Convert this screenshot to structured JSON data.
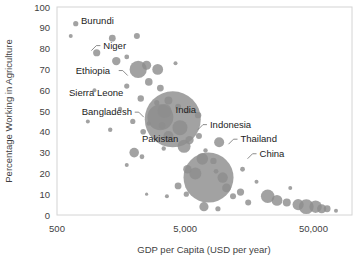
{
  "chart_data": {
    "type": "scatter",
    "title": "",
    "xlabel": "GDP per Capita (USD per year)",
    "ylabel": "Percentage Working in Agriculture",
    "xscale": "log",
    "xlim": [
      500,
      100000
    ],
    "ylim": [
      0,
      100
    ],
    "xticks": [
      "500",
      "5,000",
      "50,000"
    ],
    "xtick_values": [
      500,
      5000,
      50000
    ],
    "yticks": [
      "0",
      "10",
      "20",
      "30",
      "40",
      "50",
      "60",
      "70",
      "80",
      "90",
      "100"
    ],
    "ytick_values": [
      0,
      10,
      20,
      30,
      40,
      50,
      60,
      70,
      80,
      90,
      100
    ],
    "grid": false,
    "legend": "none",
    "bubble_color": "#8d8d8d",
    "border_color": "#d4d4d4",
    "annotations": [
      {
        "label": "Burundi",
        "x": 770,
        "y": 92,
        "anchor": "start"
      },
      {
        "label": "Niger",
        "x": 1150,
        "y": 80,
        "anchor": "start"
      },
      {
        "label": "Ethiopia",
        "x": 700,
        "y": 68,
        "anchor": "start"
      },
      {
        "label": "Sierra Leone",
        "x": 620,
        "y": 57,
        "anchor": "start"
      },
      {
        "label": "Bangladesh",
        "x": 780,
        "y": 48,
        "anchor": "start"
      },
      {
        "label": "India",
        "x": 4200,
        "y": 49,
        "anchor": "start"
      },
      {
        "label": "Pakistan",
        "x": 2300,
        "y": 35,
        "anchor": "start"
      },
      {
        "label": "Indonesia",
        "x": 7800,
        "y": 42,
        "anchor": "start"
      },
      {
        "label": "Thailand",
        "x": 13500,
        "y": 35,
        "anchor": "start"
      },
      {
        "label": "China",
        "x": 19000,
        "y": 28,
        "anchor": "start"
      }
    ],
    "points": [
      {
        "x": 700,
        "y": 92,
        "r": 2.6
      },
      {
        "x": 640,
        "y": 86,
        "r": 2.0
      },
      {
        "x": 1350,
        "y": 85,
        "r": 3.4
      },
      {
        "x": 2100,
        "y": 86,
        "r": 3.0
      },
      {
        "x": 1020,
        "y": 78,
        "r": 3.6
      },
      {
        "x": 1450,
        "y": 74,
        "r": 4.2
      },
      {
        "x": 1750,
        "y": 76,
        "r": 2.4
      },
      {
        "x": 2500,
        "y": 72,
        "r": 4.6
      },
      {
        "x": 2150,
        "y": 70,
        "r": 8.6
      },
      {
        "x": 3050,
        "y": 70,
        "r": 5.4
      },
      {
        "x": 4200,
        "y": 73,
        "r": 2.0
      },
      {
        "x": 2600,
        "y": 64,
        "r": 3.8
      },
      {
        "x": 1750,
        "y": 62,
        "r": 2.6
      },
      {
        "x": 3200,
        "y": 61,
        "r": 3.4
      },
      {
        "x": 980,
        "y": 60,
        "r": 2.0
      },
      {
        "x": 2250,
        "y": 56,
        "r": 3.2
      },
      {
        "x": 3000,
        "y": 54,
        "r": 2.6
      },
      {
        "x": 3700,
        "y": 55,
        "r": 4.0
      },
      {
        "x": 4400,
        "y": 52,
        "r": 3.0
      },
      {
        "x": 1550,
        "y": 51,
        "r": 2.2
      },
      {
        "x": 5200,
        "y": 50,
        "r": 2.6
      },
      {
        "x": 6300,
        "y": 48,
        "r": 3.2
      },
      {
        "x": 870,
        "y": 45,
        "r": 2.0
      },
      {
        "x": 1950,
        "y": 45,
        "r": 2.6
      },
      {
        "x": 2600,
        "y": 44,
        "r": 2.2
      },
      {
        "x": 3300,
        "y": 43,
        "r": 3.6
      },
      {
        "x": 3200,
        "y": 47,
        "r": 13.0
      },
      {
        "x": 2350,
        "y": 40,
        "r": 2.8
      },
      {
        "x": 1300,
        "y": 41,
        "r": 2.2
      },
      {
        "x": 4000,
        "y": 46,
        "r": 28.0
      },
      {
        "x": 3450,
        "y": 50,
        "r": 7.0
      },
      {
        "x": 4550,
        "y": 42,
        "r": 7.5
      },
      {
        "x": 3700,
        "y": 38,
        "r": 5.0
      },
      {
        "x": 2000,
        "y": 30,
        "r": 4.8
      },
      {
        "x": 2300,
        "y": 28,
        "r": 2.4
      },
      {
        "x": 4900,
        "y": 33,
        "r": 6.5
      },
      {
        "x": 5400,
        "y": 36,
        "r": 4.2
      },
      {
        "x": 6400,
        "y": 38,
        "r": 3.0
      },
      {
        "x": 7200,
        "y": 31,
        "r": 2.2
      },
      {
        "x": 6800,
        "y": 27,
        "r": 5.8
      },
      {
        "x": 8300,
        "y": 26,
        "r": 3.2
      },
      {
        "x": 9200,
        "y": 35,
        "r": 5.0
      },
      {
        "x": 3400,
        "y": 32,
        "r": 2.2
      },
      {
        "x": 1750,
        "y": 24,
        "r": 2.0
      },
      {
        "x": 8700,
        "y": 21,
        "r": 2.4
      },
      {
        "x": 7600,
        "y": 18,
        "r": 25.0
      },
      {
        "x": 6000,
        "y": 20,
        "r": 6.0
      },
      {
        "x": 5200,
        "y": 22,
        "r": 4.2
      },
      {
        "x": 9800,
        "y": 18,
        "r": 5.2
      },
      {
        "x": 10500,
        "y": 13,
        "r": 4.4
      },
      {
        "x": 11800,
        "y": 9,
        "r": 3.0
      },
      {
        "x": 4400,
        "y": 14,
        "r": 3.4
      },
      {
        "x": 5100,
        "y": 10,
        "r": 2.6
      },
      {
        "x": 3600,
        "y": 9,
        "r": 2.0
      },
      {
        "x": 2500,
        "y": 10,
        "r": 1.6
      },
      {
        "x": 13500,
        "y": 11,
        "r": 3.6
      },
      {
        "x": 15500,
        "y": 6,
        "r": 3.0
      },
      {
        "x": 7000,
        "y": 4,
        "r": 4.6
      },
      {
        "x": 9000,
        "y": 3,
        "r": 2.6
      },
      {
        "x": 22000,
        "y": 9,
        "r": 6.8
      },
      {
        "x": 26000,
        "y": 7,
        "r": 5.4
      },
      {
        "x": 31000,
        "y": 6,
        "r": 4.0
      },
      {
        "x": 38000,
        "y": 5,
        "r": 5.6
      },
      {
        "x": 44000,
        "y": 4,
        "r": 7.4
      },
      {
        "x": 52000,
        "y": 4,
        "r": 6.2
      },
      {
        "x": 58000,
        "y": 3,
        "r": 4.6
      },
      {
        "x": 64000,
        "y": 3,
        "r": 3.4
      },
      {
        "x": 75000,
        "y": 2,
        "r": 2.0
      },
      {
        "x": 33000,
        "y": 13,
        "r": 2.0
      },
      {
        "x": 18000,
        "y": 16,
        "r": 2.0
      },
      {
        "x": 14000,
        "y": 22,
        "r": 2.4
      }
    ]
  }
}
